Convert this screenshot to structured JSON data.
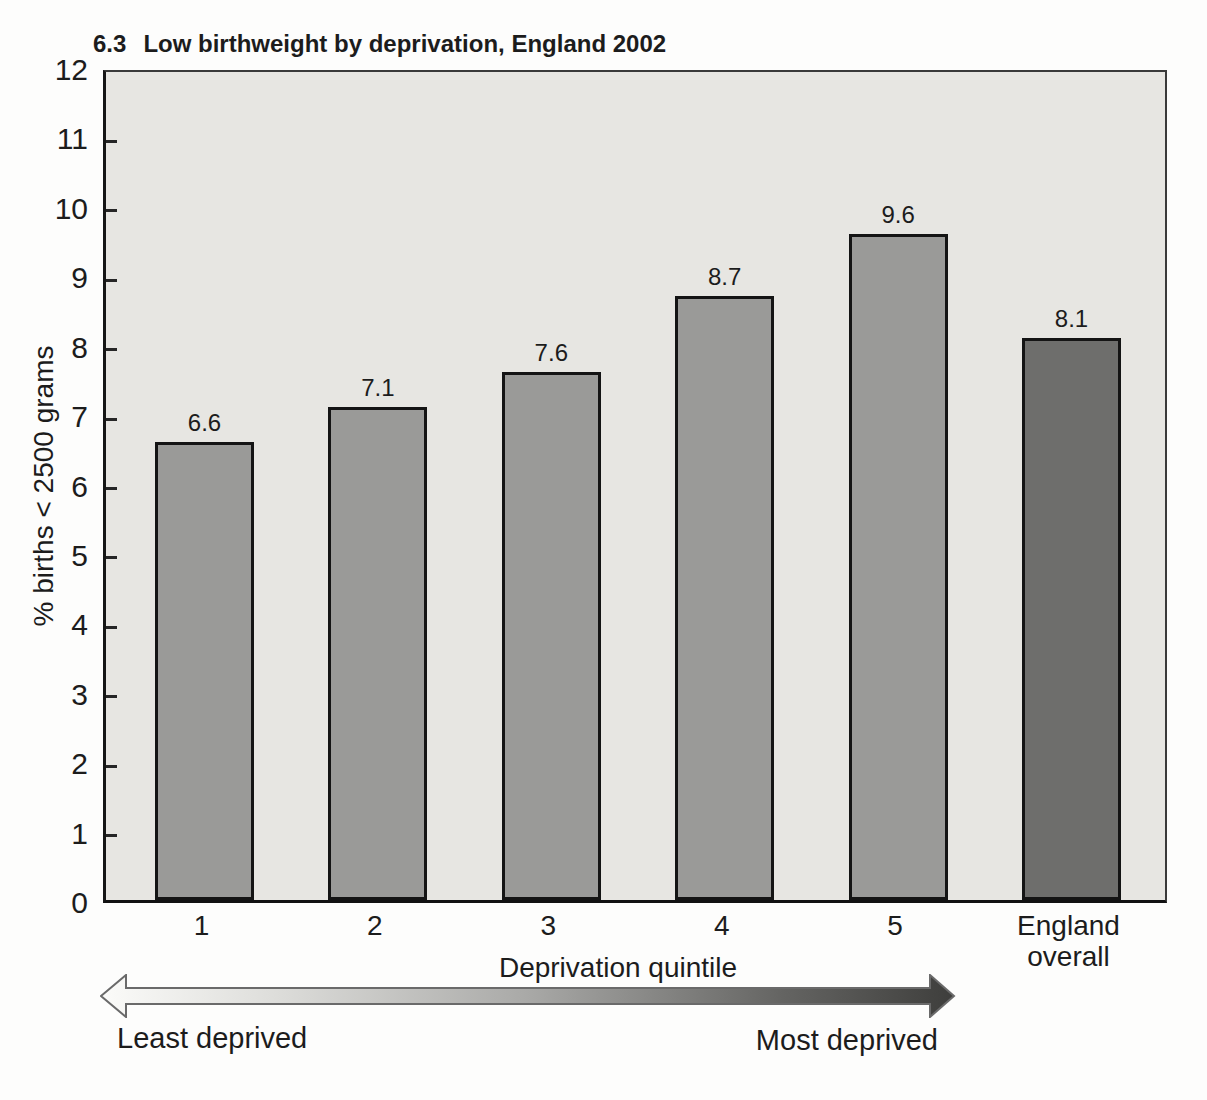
{
  "figure": {
    "number": "6.3",
    "title": "Low birthweight by deprivation, England 2002"
  },
  "chart_data": {
    "type": "bar",
    "title": "6.3 Low birthweight by deprivation, England 2002",
    "categories": [
      "1",
      "2",
      "3",
      "4",
      "5",
      "England overall"
    ],
    "values": [
      6.6,
      7.1,
      7.6,
      8.7,
      9.6,
      8.1
    ],
    "bar_labels": [
      "6.6",
      "7.1",
      "7.6",
      "8.7",
      "9.6",
      "8.1"
    ],
    "xlabel": "Deprivation quintile",
    "ylabel": "% births < 2500 grams",
    "ylim": [
      0,
      12
    ],
    "ytick_interval": 1,
    "ytick_labels": [
      "0",
      "1",
      "2",
      "3",
      "4",
      "5",
      "6",
      "7",
      "8",
      "9",
      "10",
      "11",
      "12"
    ],
    "grid": false,
    "legend": "none",
    "bar_colors": [
      "#9a9a98",
      "#9a9a98",
      "#9a9a98",
      "#9a9a98",
      "#9a9a98",
      "#6e6e6c"
    ]
  },
  "annotation_arrow": {
    "left_label": "Least deprived",
    "right_label": "Most deprived",
    "gradient_stops": [
      [
        "0%",
        "#fbfbf9"
      ],
      [
        "20%",
        "#dededb"
      ],
      [
        "50%",
        "#a9a9a7"
      ],
      [
        "80%",
        "#646462"
      ],
      [
        "100%",
        "#3e3e3c"
      ]
    ],
    "outline_color": "#6a6a6a"
  },
  "colors": {
    "page_bg": "#fdfdfc",
    "plot_bg": "#e7e6e2",
    "bar_border": "#141414",
    "axis": "#262626",
    "text": "#1c1c1c"
  }
}
